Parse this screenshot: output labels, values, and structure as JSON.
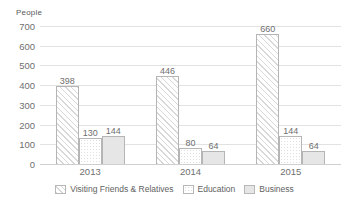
{
  "chart_data": {
    "type": "bar",
    "title": "",
    "xlabel": "",
    "ylabel": "People",
    "ylim": [
      0,
      700
    ],
    "yticks": [
      0,
      100,
      200,
      300,
      400,
      500,
      600,
      700
    ],
    "grid": true,
    "legend_position": "bottom",
    "categories": [
      "2013",
      "2014",
      "2015"
    ],
    "series": [
      {
        "name": "Visiting Friends & Relatives",
        "pattern": "diagonal-hatch",
        "color": "#fbfbfb",
        "values": [
          398,
          446,
          660
        ]
      },
      {
        "name": "Education",
        "pattern": "fine-dots",
        "color": "#ffffff",
        "values": [
          130,
          80,
          144
        ]
      },
      {
        "name": "Business",
        "pattern": "solid",
        "color": "#e6e6e6",
        "values": [
          144,
          64,
          64
        ]
      }
    ],
    "data_labels": [
      [
        "398",
        "130",
        "144"
      ],
      [
        "446",
        "80",
        "64"
      ],
      [
        "660",
        "144",
        "64"
      ]
    ],
    "axis_tick_labels": [
      "0",
      "100",
      "200",
      "300",
      "400",
      "500",
      "600",
      "700"
    ],
    "gridline_color": "#e2e2e2",
    "axis_color": "#cfcfcf",
    "text_color": "#6f6f6f"
  },
  "legend": {
    "items": [
      {
        "label": "Visiting Friends & Relatives"
      },
      {
        "label": "Education"
      },
      {
        "label": "Business"
      }
    ]
  }
}
